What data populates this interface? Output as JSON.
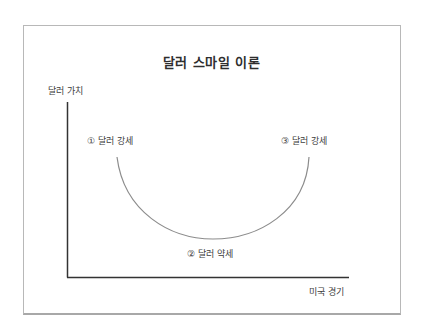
{
  "diagram": {
    "title": "달러 스마일 이론",
    "y_axis_label": "달러 가치",
    "x_axis_label": "미국 경기",
    "points": [
      {
        "marker": "①",
        "label": "① 달러 강세"
      },
      {
        "marker": "②",
        "label": "② 달러 약세"
      },
      {
        "marker": "③",
        "label": "③ 달러 강세"
      }
    ],
    "curve_shape": "smile (U-shaped)",
    "colors": {
      "axis": "#333333",
      "curve": "#8c8c8c",
      "frame": "#b8b8b8",
      "text": "#3c3c3c"
    }
  }
}
